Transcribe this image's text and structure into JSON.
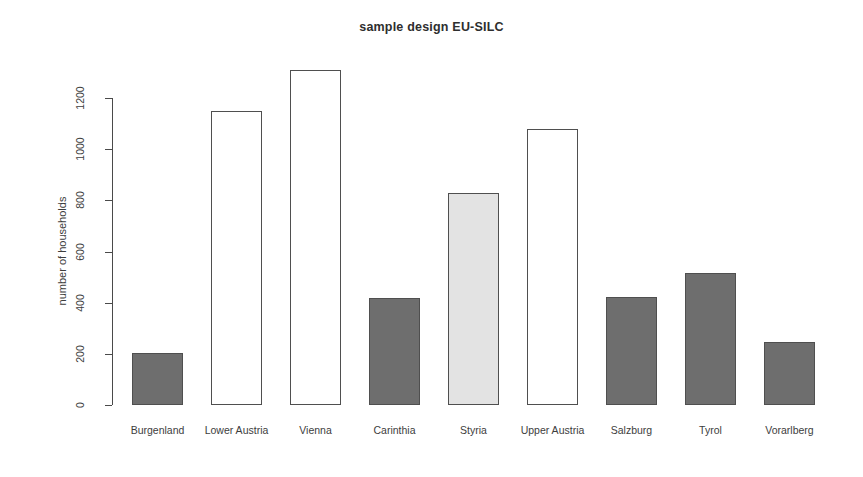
{
  "chart_data": {
    "type": "bar",
    "title": "sample design EU-SILC",
    "xlabel": "",
    "ylabel": "number of households",
    "categories": [
      "Burgenland",
      "Lower Austria",
      "Vienna",
      "Carinthia",
      "Styria",
      "Upper Austria",
      "Salzburg",
      "Tyrol",
      "Vorarlberg"
    ],
    "values": [
      205,
      1150,
      1310,
      418,
      828,
      1078,
      422,
      515,
      248
    ],
    "bar_colors": [
      "#6e6e6e",
      "#ffffff",
      "#ffffff",
      "#6e6e6e",
      "#e3e3e3",
      "#ffffff",
      "#6e6e6e",
      "#6e6e6e",
      "#6e6e6e"
    ],
    "bar_border_color": "#4f4f4f",
    "ylim": [
      0,
      1310
    ],
    "ytick_values": [
      0,
      200,
      400,
      600,
      800,
      1000,
      1200
    ],
    "ytick_labels": [
      "0",
      "200",
      "400",
      "600",
      "800",
      "1000",
      "1200"
    ],
    "grid": false,
    "legend": null,
    "axis_color": "#4a4a4a",
    "background": "#ffffff"
  }
}
